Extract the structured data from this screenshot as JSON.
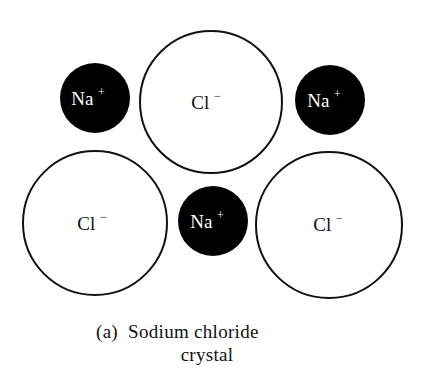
{
  "diagram": {
    "ions": [
      {
        "id": "na-top-left",
        "symbol": "Na",
        "charge": "+",
        "type": "cation",
        "fill": "#000000",
        "text_color": "#ffffff"
      },
      {
        "id": "cl-top-center",
        "symbol": "Cl",
        "charge": "−",
        "type": "anion",
        "fill": "#ffffff",
        "text_color": "#111111"
      },
      {
        "id": "na-top-right",
        "symbol": "Na",
        "charge": "+",
        "type": "cation",
        "fill": "#000000",
        "text_color": "#ffffff"
      },
      {
        "id": "cl-bottom-left",
        "symbol": "Cl",
        "charge": "−",
        "type": "anion",
        "fill": "#ffffff",
        "text_color": "#111111"
      },
      {
        "id": "na-bottom-center",
        "symbol": "Na",
        "charge": "+",
        "type": "cation",
        "fill": "#000000",
        "text_color": "#ffffff"
      },
      {
        "id": "cl-bottom-right",
        "symbol": "Cl",
        "charge": "−",
        "type": "anion",
        "fill": "#ffffff",
        "text_color": "#111111"
      }
    ],
    "caption": {
      "line1": "(a)  Sodium chloride",
      "line2": "crystal"
    }
  }
}
